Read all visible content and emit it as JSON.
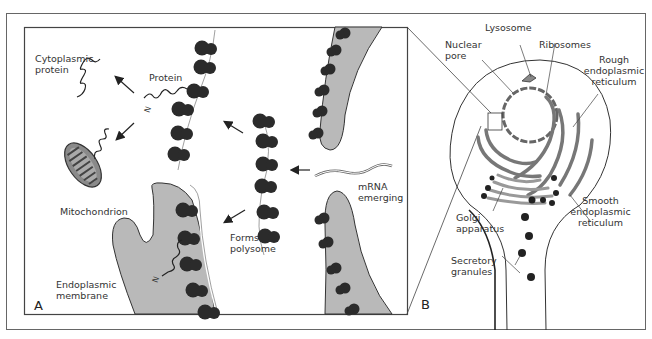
{
  "figure": {
    "colors": {
      "ink": "#222222",
      "ribosome": "#2b2b2b",
      "membrane_fill": "#b9b9b9",
      "frame": "#555555",
      "background": "#ffffff"
    },
    "panel_a": {
      "letter": "A",
      "labels": {
        "cytoplasmic_protein": "Cytoplasmic\nprotein",
        "protein": "Protein",
        "n_terminus_top": "N",
        "n_terminus_bottom": "N",
        "mitochondrion": "Mitochondrion",
        "endoplasmic_membrane": "Endoplasmic\nmembrane",
        "forms_polysome": "Forms\npolysome",
        "mrna_emerging": "mRNA\nemerging"
      }
    },
    "panel_b": {
      "letter": "B",
      "labels": {
        "lysosome": "Lysosome",
        "nuclear_pore": "Nuclear\npore",
        "ribosomes": "Ribosomes",
        "rough_er": "Rough\nendoplasmic\nreticulum",
        "smooth_er": "Smooth\nendoplasmic\nreticulum",
        "golgi": "Golgi\napparatus",
        "secretory_granules": "Secretory\ngranules"
      }
    }
  }
}
